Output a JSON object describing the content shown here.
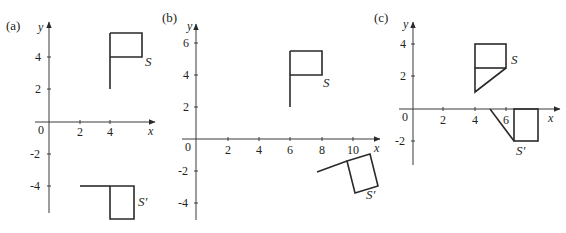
{
  "panels": [
    {
      "id": "a",
      "label": "(a)",
      "axis_x_label": "x",
      "axis_y_label": "y",
      "origin_label": "0",
      "x_ticks": [
        "2",
        "4"
      ],
      "y_ticks": [
        "4",
        "2",
        "-2",
        "-4"
      ],
      "shape_label": "S",
      "image_label": "S′",
      "transformation_description": "S pole from (4,2) to (4,5.5), flag (4,4)-(6,5.5); S′ pole from (2,-4) to (4,-4), flag (4,-4)-(5.5,-6)"
    },
    {
      "id": "b",
      "label": "(b)",
      "axis_x_label": "x",
      "axis_y_label": "y",
      "origin_label": "0",
      "x_ticks": [
        "2",
        "4",
        "6",
        "8",
        "10"
      ],
      "y_ticks": [
        "6",
        "4",
        "2",
        "-2",
        "-4"
      ],
      "shape_label": "S",
      "image_label": "S′",
      "transformation_description": "S pole from (6,2) to (6,5.5), flag (6,4)-(8,5.5); S′ rotated flag near (8,-2) to (11.5,-3.5)"
    },
    {
      "id": "c",
      "label": "(c)",
      "axis_x_label": "x",
      "axis_y_label": "y",
      "origin_label": "0",
      "x_ticks": [
        "2",
        "4",
        "6"
      ],
      "y_ticks": [
        "4",
        "2",
        "-2"
      ],
      "shape_label": "S",
      "image_label": "S′",
      "transformation_description": "S rectangle (4,2.5)-(6,4) with triangle (4,2.5),(6,2.5),(4,1); S′ rectangle (6.5,0)-(8,-2) with triangle (5,0),(6.5,0),(6.5,-2)"
    }
  ]
}
